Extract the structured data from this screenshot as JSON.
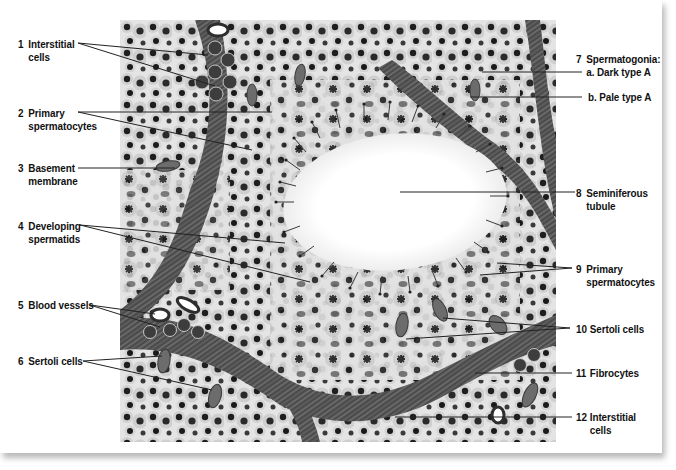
{
  "figure": {
    "colors": {
      "background": "#ffffff",
      "tissue": "#e6e6e6",
      "lumen": "#ffffff",
      "connective_tissue": "#5a5a5a",
      "nuclei": "#1e1e1e",
      "leader_lines": "#222222",
      "label_text": "#111111"
    }
  },
  "labels_left": [
    {
      "number": "1",
      "line1": "Interstitial",
      "line2": "cells"
    },
    {
      "number": "2",
      "line1": "Primary",
      "line2": "spermatocytes"
    },
    {
      "number": "3",
      "line1": "Basement",
      "line2": "membrane"
    },
    {
      "number": "4",
      "line1": "Developing",
      "line2": "spermatids"
    },
    {
      "number": "5",
      "line1": "Blood vessels",
      "line2": ""
    },
    {
      "number": "6",
      "line1": "Sertoli cells",
      "line2": ""
    }
  ],
  "labels_right": [
    {
      "number": "7",
      "line1": "Spermatogonia:",
      "line2": "a. Dark type A"
    },
    {
      "number": "",
      "line1": "b. Pale type A",
      "line2": ""
    },
    {
      "number": "8",
      "line1": "Seminiferous",
      "line2": "tubule"
    },
    {
      "number": "9",
      "line1": "Primary",
      "line2": "spermatocytes"
    },
    {
      "number": "10",
      "line1": "Sertoli cells",
      "line2": ""
    },
    {
      "number": "11",
      "line1": "Fibrocytes",
      "line2": ""
    },
    {
      "number": "12",
      "line1": "Interstitial",
      "line2": "cells"
    }
  ]
}
